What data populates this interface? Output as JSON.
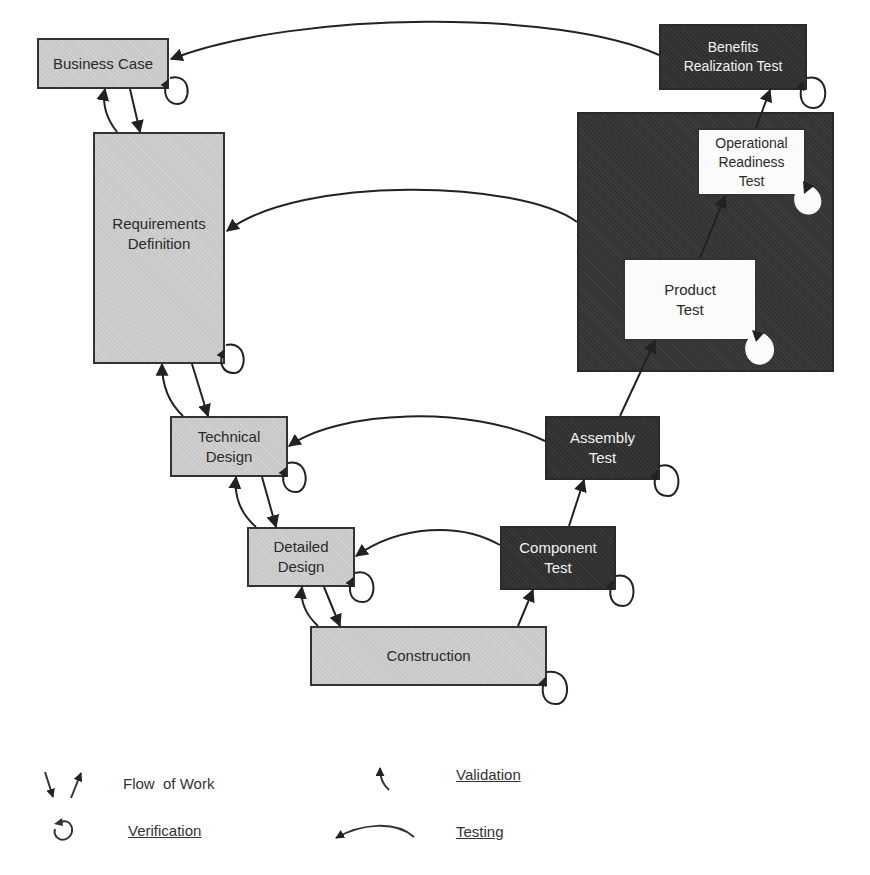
{
  "diagram": {
    "type": "v-model",
    "colors": {
      "design_phase_fill": "#c8c8c8",
      "test_phase_fill": "#2f2f2f",
      "test_container_fill": "#333333",
      "inner_box_fill": "#fbfbfb",
      "line": "#222222"
    },
    "design_phases": [
      {
        "id": "business_case",
        "label": "Business Case"
      },
      {
        "id": "requirements_definition",
        "label": "Requirements\nDefinition"
      },
      {
        "id": "technical_design",
        "label": "Technical\nDesign"
      },
      {
        "id": "detailed_design",
        "label": "Detailed\nDesign"
      },
      {
        "id": "construction",
        "label": "Construction"
      }
    ],
    "test_phases": [
      {
        "id": "component_test",
        "label": "Component\nTest"
      },
      {
        "id": "assembly_test",
        "label": "Assembly\nTest"
      },
      {
        "id": "product_test",
        "label": "Product\nTest"
      },
      {
        "id": "operational_readiness_test",
        "label": "Operational\nReadiness\nTest"
      },
      {
        "id": "benefits_realization_test",
        "label": "Benefits\nRealization Test"
      }
    ],
    "testing_links": [
      {
        "from": "Benefits Realization Test",
        "to": "Business Case"
      },
      {
        "from": "Product/Operational Readiness Test",
        "to": "Requirements Definition"
      },
      {
        "from": "Assembly Test",
        "to": "Technical Design"
      },
      {
        "from": "Component Test",
        "to": "Detailed Design"
      }
    ]
  },
  "legend": {
    "flow_of_work": "Flow  of Work",
    "verification": "Verification",
    "validation": "Validation",
    "testing": "Testing"
  }
}
